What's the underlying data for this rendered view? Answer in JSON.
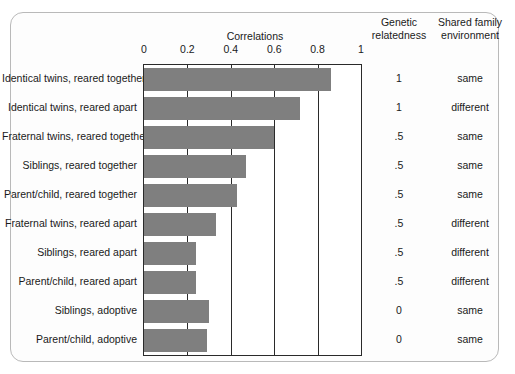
{
  "figure": {
    "title": "Correlations",
    "column_headers": {
      "genetic": "Genetic relatedness",
      "genetic_line1": "Genetic",
      "genetic_line2": "relatedness",
      "shared": "Shared family environment",
      "shared_line1": "Shared family",
      "shared_line2": "environment"
    },
    "bar_color": "#7f7f7f",
    "axis_color": "#2a2a2a",
    "frame_color": "#b9b9b9"
  },
  "chart_data": {
    "type": "bar",
    "orientation": "horizontal",
    "title": "Correlations",
    "xlabel": "",
    "ylabel": "",
    "xlim": [
      0,
      1
    ],
    "xticks": [
      "0",
      "0.2",
      "0.4",
      "0.6",
      "0.8",
      "1"
    ],
    "xtick_values": [
      0,
      0.2,
      0.4,
      0.6,
      0.8,
      1
    ],
    "grid": true,
    "legend": "none",
    "categories": [
      "Identical twins, reared together",
      "Identical twins, reared apart",
      "Fraternal twins, reared together",
      "Siblings, reared together",
      "Parent/child, reared together",
      "Fraternal twins, reared apart",
      "Siblings, reared apart",
      "Parent/child, reared apart",
      "Siblings, adoptive",
      "Parent/child, adoptive"
    ],
    "values": [
      0.86,
      0.72,
      0.6,
      0.47,
      0.43,
      0.33,
      0.24,
      0.24,
      0.3,
      0.29
    ],
    "annotations": {
      "genetic_relatedness": [
        "1",
        "1",
        ".5",
        ".5",
        ".5",
        ".5",
        ".5",
        ".5",
        "0",
        "0"
      ],
      "shared_family_environment": [
        "same",
        "different",
        "same",
        "same",
        "same",
        "different",
        "different",
        "different",
        "same",
        "same"
      ]
    }
  }
}
